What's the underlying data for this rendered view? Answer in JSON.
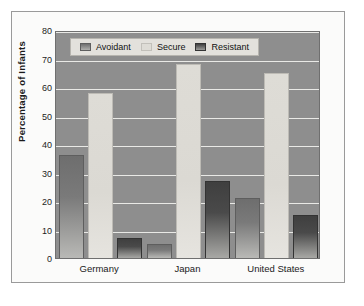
{
  "chart_data": {
    "type": "bar",
    "title": "",
    "subtitle": "",
    "xlabel": "",
    "ylabel": "Percentage of Infants",
    "categories": [
      "Germany",
      "Japan",
      "United States"
    ],
    "series": [
      {
        "name": "Avoidant",
        "values": [
          36,
          5,
          21
        ],
        "color": "#7a7a7a"
      },
      {
        "name": "Secure",
        "values": [
          58,
          68,
          65
        ],
        "color": "#dedcd6"
      },
      {
        "name": "Resistant",
        "values": [
          7,
          27,
          15
        ],
        "color": "#4a4a4a"
      }
    ],
    "ylim": [
      0,
      80
    ],
    "yticks": [
      0,
      10,
      20,
      30,
      40,
      50,
      60,
      70,
      80
    ],
    "ytick_labels": [
      "0",
      "10",
      "20",
      "30",
      "40",
      "50",
      "60",
      "70",
      "80"
    ],
    "grid": true,
    "legend_position": "top-left",
    "plot_background": "#8e8e8e",
    "gridline_color": "#e9e9e6",
    "figure_background": "#fbfbfa",
    "frame_color": "#9a9a9a"
  },
  "legend": {
    "entries": [
      {
        "label": "Avoidant",
        "swatch": "avoidant-swatch"
      },
      {
        "label": "Secure",
        "swatch": "secure-swatch"
      },
      {
        "label": "Resistant",
        "swatch": "resistant-swatch"
      }
    ]
  }
}
